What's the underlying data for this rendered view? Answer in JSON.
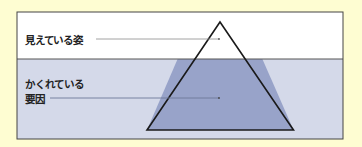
{
  "labels": {
    "visible": "見えている姿",
    "hidden_line1": "かくれている",
    "hidden_line2": "要因"
  },
  "colors": {
    "page_background": "#fefdd2",
    "above_water": "#ffffff",
    "below_water": "#d4d9e9",
    "iceberg_submerged": "#98a3c9",
    "outline": "#222222",
    "leader_above": "#8a8a8a",
    "leader_below": "#6d7899"
  }
}
